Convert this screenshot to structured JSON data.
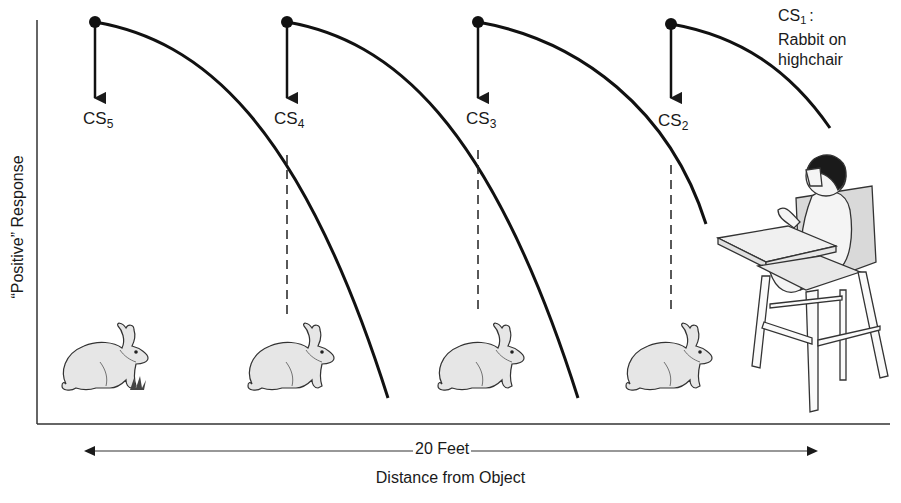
{
  "figure": {
    "y_axis_label": "“Positive” Response",
    "x_axis_label": "Distance from Object",
    "distance_label": "20 Feet",
    "cs1_label": {
      "name": "CS",
      "subscript": "1",
      "suffix": ":",
      "line2": "Rabbit on",
      "line3": "highchair"
    },
    "stimuli": [
      {
        "name": "CS",
        "subscript": "5",
        "x": 95
      },
      {
        "name": "CS",
        "subscript": "4",
        "x": 287
      },
      {
        "name": "CS",
        "subscript": "3",
        "x": 478
      },
      {
        "name": "CS",
        "subscript": "2",
        "x": 671
      }
    ],
    "colors": {
      "ink": "#1a1a1a",
      "rabbit_fill": "#e8e8e8",
      "chair_fill": "#f0f0f0",
      "background": "#ffffff"
    }
  }
}
